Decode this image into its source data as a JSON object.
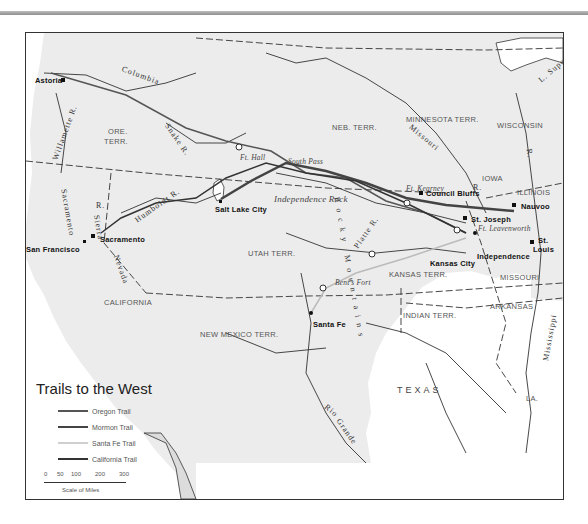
{
  "map": {
    "title": "Trails to the West",
    "legend": {
      "items": [
        {
          "label": "Oregon Trail",
          "color": "#555555",
          "width": 1.5
        },
        {
          "label": "Mormon Trail",
          "color": "#444444",
          "width": 2.5
        },
        {
          "label": "Santa Fe Trail",
          "color": "#cfcfcf",
          "width": 1.5
        },
        {
          "label": "California Trail",
          "color": "#333333",
          "width": 1.5
        }
      ],
      "scale": {
        "ticks": [
          "0",
          "50",
          "100",
          "200",
          "300"
        ],
        "caption": "Scale of Miles"
      }
    },
    "territories": [
      {
        "label": "ORE.",
        "x": 82,
        "y": 95
      },
      {
        "label": "TERR.",
        "x": 80,
        "y": 108
      },
      {
        "label": "NEB. TERR.",
        "x": 306,
        "y": 92
      },
      {
        "label": "MINNESOTA TERR.",
        "x": 380,
        "y": 84
      },
      {
        "label": "WISCONSIN",
        "x": 471,
        "y": 88
      },
      {
        "label": "IOWA",
        "x": 456,
        "y": 141
      },
      {
        "label": "ILLINOIS",
        "x": 491,
        "y": 155
      },
      {
        "label": "UTAH TERR.",
        "x": 222,
        "y": 216
      },
      {
        "label": "KANSAS TERR.",
        "x": 363,
        "y": 237
      },
      {
        "label": "MISSOURI",
        "x": 474,
        "y": 240
      },
      {
        "label": "CALIFORNIA",
        "x": 78,
        "y": 265
      },
      {
        "label": "NEW MEXICO TERR.",
        "x": 174,
        "y": 297
      },
      {
        "label": "INDIAN TERR.",
        "x": 377,
        "y": 278
      },
      {
        "label": "ARKANSAS",
        "x": 464,
        "y": 269
      },
      {
        "label": "LA.",
        "x": 500,
        "y": 361
      }
    ],
    "states_large": [
      {
        "label": "TEXAS",
        "x": 371,
        "y": 352
      }
    ],
    "cities": [
      {
        "label": "Astoria",
        "x": 9,
        "y": 47
      },
      {
        "label": "San Francisco",
        "x": 0,
        "y": 216
      },
      {
        "label": "Sacramento",
        "x": 74,
        "y": 204
      },
      {
        "label": "Salt Lake City",
        "x": 189,
        "y": 174
      },
      {
        "label": "Council Bluffs",
        "x": 400,
        "y": 158
      },
      {
        "label": "Nauvoo",
        "x": 495,
        "y": 170
      },
      {
        "label": "St. Joseph",
        "x": 445,
        "y": 183
      },
      {
        "label": "St.",
        "x": 542,
        "y": 207
      },
      {
        "label": "Louis",
        "x": 537,
        "y": 216
      },
      {
        "label": "Kansas City",
        "x": 404,
        "y": 228
      },
      {
        "label": "Independence",
        "x": 451,
        "y": 220
      },
      {
        "label": "Santa Fe",
        "x": 287,
        "y": 289
      }
    ],
    "forts": [
      {
        "label": "Ft. Hall",
        "x": 214,
        "y": 122
      },
      {
        "label": "South Pass",
        "x": 268,
        "y": 126
      },
      {
        "label": "Independence Rock",
        "x": 248,
        "y": 163
      },
      {
        "label": "Ft. Kearney",
        "x": 380,
        "y": 153
      },
      {
        "label": "Ft. Leavenworth",
        "x": 480,
        "y": 191
      },
      {
        "label": "Bent's Fort",
        "x": 309,
        "y": 246
      }
    ],
    "rivers": [
      {
        "label": "Columbia",
        "x": 100,
        "y": 40,
        "rotate": 20
      },
      {
        "label": "Willamette R.",
        "x": 20,
        "y": 105,
        "rotate": -70
      },
      {
        "label": "Snake R.",
        "x": 140,
        "y": 105,
        "rotate": 55
      },
      {
        "label": "Humboldt R.",
        "x": 115,
        "y": 171,
        "rotate": -35
      },
      {
        "label": "Sacramento",
        "x": 37,
        "y": 178,
        "rotate": 80
      },
      {
        "label": "Sierra",
        "x": 68,
        "y": 195,
        "rotate": 80
      },
      {
        "label": "Nevada",
        "x": 90,
        "y": 235,
        "rotate": 70
      },
      {
        "label": "R.",
        "x": 70,
        "y": 170,
        "rotate": 0
      },
      {
        "label": "Missouri",
        "x": 390,
        "y": 103,
        "rotate": 40
      },
      {
        "label": "R.",
        "x": 447,
        "y": 153,
        "rotate": 0
      },
      {
        "label": "Platte R.",
        "x": 333,
        "y": 197,
        "rotate": -55
      },
      {
        "label": "Mississippi",
        "x": 522,
        "y": 305,
        "rotate": -80
      },
      {
        "label": "R.",
        "x": 501,
        "y": 120,
        "rotate": 80
      },
      {
        "label": "Rio",
        "x": 300,
        "y": 375,
        "rotate": 40
      },
      {
        "label": "Grande",
        "x": 313,
        "y": 395,
        "rotate": 55
      },
      {
        "label": "L. Superior",
        "x": 522,
        "y": 30,
        "rotate": -40
      },
      {
        "label": "Rocky Mountains",
        "x": 276,
        "y": 230,
        "rotate": 80
      }
    ]
  }
}
